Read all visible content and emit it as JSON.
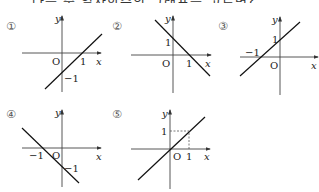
{
  "header": {
    "clipped_text": "다음 중 일차함수의 그래프를 고르면?"
  },
  "graphs": [
    {
      "label": "①",
      "x_axis": "x",
      "y_axis": "y",
      "origin": "O",
      "tick_x": "1",
      "tick_y": "−1"
    },
    {
      "label": "②",
      "x_axis": "x",
      "y_axis": "y",
      "origin": "O",
      "tick_x": "1",
      "tick_y": "1"
    },
    {
      "label": "③",
      "x_axis": "x",
      "y_axis": "y",
      "origin": "O",
      "tick_x": "−1",
      "tick_y": "1"
    },
    {
      "label": "④",
      "x_axis": "x",
      "y_axis": "y",
      "origin": "O",
      "tick_x": "−1",
      "tick_y": "−1"
    },
    {
      "label": "⑤",
      "x_axis": "x",
      "y_axis": "y",
      "origin": "O",
      "tick_x": "1",
      "tick_y": "1"
    }
  ]
}
